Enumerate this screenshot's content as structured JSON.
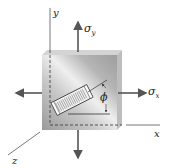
{
  "figure": {
    "axes": {
      "x": "x",
      "y": "y",
      "z": "z"
    },
    "stresses": {
      "sigma_x": "σ",
      "sigma_x_sub": "x",
      "sigma_y": "σ",
      "sigma_y_sub": "y"
    },
    "angle": "ϕ",
    "colors": {
      "plate_light": "#e8e8e8",
      "plate_dark": "#8a8a8a",
      "arrow": "#555555",
      "line": "#333333"
    }
  }
}
